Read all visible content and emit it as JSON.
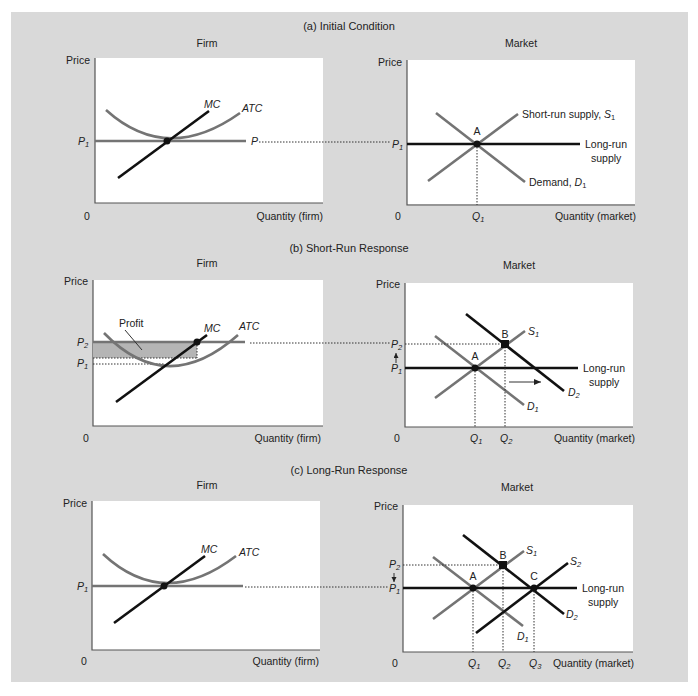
{
  "figure": {
    "panels": [
      {
        "id": "a",
        "title": "(a) Initial Condition",
        "firm": {
          "title": "Firm",
          "y_label": "Price",
          "x_label": "Quantity (firm)",
          "origin": "0",
          "curves": {
            "mc": "MC",
            "atc": "ATC"
          },
          "price_labels": {
            "p1": "P",
            "p_line": "P"
          },
          "p1_sub": "1"
        },
        "market": {
          "title": "Market",
          "y_label": "Price",
          "x_label": "Quantity (market)",
          "origin": "0",
          "supply_label": "Short-run supply, ",
          "supply_sym": "S",
          "supply_sub": "1",
          "demand_label": "Demand, ",
          "demand_sym": "D",
          "demand_sub": "1",
          "lr_supply_1": "Long-run",
          "lr_supply_2": "supply",
          "point_a": "A",
          "q_sym": "Q",
          "q1_sub": "1",
          "p_sym": "P",
          "p1_sub": "1"
        }
      },
      {
        "id": "b",
        "title": "(b) Short-Run Response",
        "firm": {
          "title": "Firm",
          "y_label": "Price",
          "x_label": "Quantity (firm)",
          "origin": "0",
          "curves": {
            "mc": "MC",
            "atc": "ATC"
          },
          "profit_label": "Profit",
          "p_sym": "P",
          "p1_sub": "1",
          "p2_sub": "2"
        },
        "market": {
          "title": "Market",
          "y_label": "Price",
          "x_label": "Quantity (market)",
          "origin": "0",
          "s_sym": "S",
          "s1_sub": "1",
          "d_sym": "D",
          "d1_sub": "1",
          "d2_sub": "2",
          "lr_supply_1": "Long-run",
          "lr_supply_2": "supply",
          "point_a": "A",
          "point_b": "B",
          "q_sym": "Q",
          "q1_sub": "1",
          "q2_sub": "2",
          "p_sym": "P",
          "p1_sub": "1",
          "p2_sub": "2"
        }
      },
      {
        "id": "c",
        "title": "(c) Long-Run Response",
        "firm": {
          "title": "Firm",
          "y_label": "Price",
          "x_label": "Quantity (firm)",
          "origin": "0",
          "curves": {
            "mc": "MC",
            "atc": "ATC"
          },
          "p_sym": "P",
          "p1_sub": "1"
        },
        "market": {
          "title": "Market",
          "y_label": "Price",
          "x_label": "Quantity (market)",
          "origin": "0",
          "s_sym": "S",
          "s1_sub": "1",
          "s2_sub": "2",
          "d_sym": "D",
          "d1_sub": "1",
          "d2_sub": "2",
          "lr_supply_1": "Long-run",
          "lr_supply_2": "supply",
          "point_a": "A",
          "point_b": "B",
          "point_c": "C",
          "q_sym": "Q",
          "q1_sub": "1",
          "q2_sub": "2",
          "q3_sub": "3",
          "p_sym": "P",
          "p1_sub": "1",
          "p2_sub": "2"
        }
      }
    ],
    "colors": {
      "frame_bg": "#d9d9d9",
      "plot_bg": "#ffffff",
      "curve_gray": "#747474",
      "curve_black": "#111111",
      "profit_fill": "#b5b5b5"
    }
  }
}
